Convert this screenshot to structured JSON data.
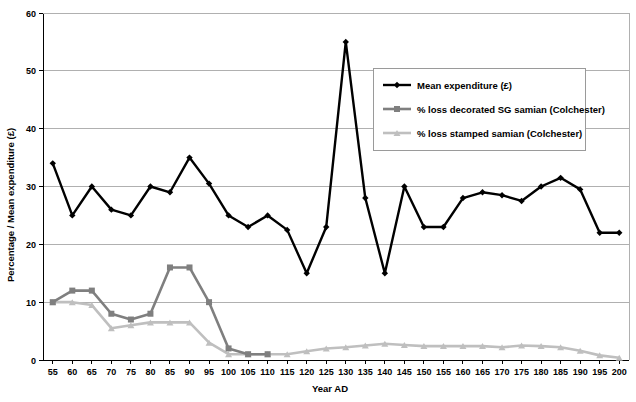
{
  "chart_data": {
    "type": "line",
    "title": "",
    "xlabel": "Year AD",
    "ylabel": "Percentage / Mean expenditure (£)",
    "ylim": [
      0,
      60
    ],
    "ytick_step": 10,
    "yticks": [
      0,
      10,
      20,
      30,
      40,
      50,
      60
    ],
    "grid": "horizontal",
    "legend_position": "upper-right-inside",
    "categories": [
      55,
      60,
      65,
      70,
      75,
      80,
      85,
      90,
      95,
      100,
      105,
      110,
      115,
      120,
      125,
      130,
      135,
      140,
      145,
      150,
      155,
      160,
      165,
      170,
      175,
      180,
      185,
      190,
      195,
      200
    ],
    "series": [
      {
        "name": "Mean expenditure (£)",
        "color": "#000000",
        "marker": "diamond",
        "values": [
          34,
          25,
          30,
          26,
          25,
          30,
          29,
          35,
          30.5,
          25,
          23,
          25,
          22.5,
          15,
          23,
          55,
          28,
          15,
          30,
          23,
          23,
          28,
          29,
          28.5,
          27.5,
          30,
          31.5,
          29.5,
          22,
          22
        ]
      },
      {
        "name": "% loss decorated SG samian (Colchester)",
        "color": "#7f7f7f",
        "marker": "square",
        "values": [
          10,
          12,
          12,
          8,
          7,
          8,
          16,
          16,
          10,
          2,
          1,
          1,
          null,
          null,
          null,
          null,
          null,
          null,
          null,
          null,
          null,
          null,
          null,
          null,
          null,
          null,
          null,
          null,
          null,
          null
        ]
      },
      {
        "name": "% loss stamped samian (Colchester)",
        "color": "#bfbfbf",
        "marker": "triangle",
        "values": [
          10,
          10,
          9.5,
          5.5,
          6,
          6.5,
          6.5,
          6.5,
          3,
          1,
          1,
          1,
          1,
          1.5,
          2,
          2.2,
          2.5,
          2.8,
          2.6,
          2.4,
          2.4,
          2.4,
          2.4,
          2.2,
          2.5,
          2.4,
          2.2,
          1.6,
          0.8,
          0.4
        ]
      }
    ]
  },
  "axis": {
    "y_title": "Percentage / Mean expenditure (£)",
    "x_title": "Year AD",
    "y_labels": [
      "0",
      "10",
      "20",
      "30",
      "40",
      "50",
      "60"
    ],
    "x_labels": [
      "55",
      "60",
      "65",
      "70",
      "75",
      "80",
      "85",
      "90",
      "95",
      "100",
      "105",
      "110",
      "115",
      "120",
      "125",
      "130",
      "135",
      "140",
      "145",
      "150",
      "155",
      "160",
      "165",
      "170",
      "175",
      "180",
      "185",
      "190",
      "195",
      "200"
    ]
  },
  "legend": {
    "entries": [
      {
        "label": "Mean expenditure (£)",
        "color": "#000000",
        "marker": "diamond"
      },
      {
        "label": "% loss decorated SG samian (Colchester)",
        "color": "#7f7f7f",
        "marker": "square"
      },
      {
        "label": "% loss stamped samian (Colchester)",
        "color": "#bfbfbf",
        "marker": "triangle"
      }
    ]
  },
  "colors": {
    "background": "#ffffff",
    "axis": "#000000",
    "gridline": "#b0b0b0",
    "legend_border": "#9a9a9a",
    "series_black": "#000000",
    "series_dark_grey": "#7f7f7f",
    "series_light_grey": "#bfbfbf"
  }
}
